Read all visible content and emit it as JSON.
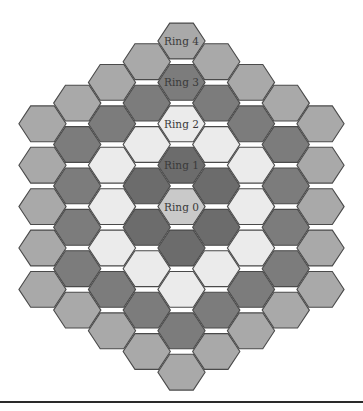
{
  "diagram": {
    "orientation": "flat-top",
    "max_ring": 4,
    "center": {
      "x": 181.5,
      "y": 206.6
    },
    "hex_radius": 23.6,
    "col_spacing": 34.75,
    "row_spacing": 41.4,
    "stroke_color": "#4a4a4a",
    "rings": [
      {
        "index": 0,
        "label": "Ring 0",
        "color": "#c9c9c9",
        "hex_count": 1
      },
      {
        "index": 1,
        "label": "Ring 1",
        "color": "#6c6c6c",
        "hex_count": 6
      },
      {
        "index": 2,
        "label": "Ring 2",
        "color": "#ebebeb",
        "hex_count": 12
      },
      {
        "index": 3,
        "label": "Ring 3",
        "color": "#7c7c7c",
        "hex_count": 18
      },
      {
        "index": 4,
        "label": "Ring 4",
        "color": "#a9a9a9",
        "hex_count": 24
      }
    ]
  },
  "labels": {
    "ring0": "Ring 0",
    "ring1": "Ring 1",
    "ring2": "Ring 2",
    "ring3": "Ring 3",
    "ring4": "Ring 4"
  }
}
